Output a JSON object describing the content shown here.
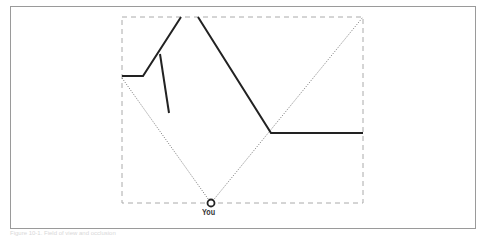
{
  "figure": {
    "type": "field-of-view diagram",
    "viewer_label": "You",
    "caption": "Figure 10-1. Field of view and occlusion",
    "colors": {
      "frame": "#9a9a9a",
      "view_box": "#aaaaaa",
      "walls": "#222222",
      "sight_lines": "#555555"
    },
    "view_box": {
      "x": 122,
      "y": 17,
      "width": 241,
      "height": 186
    },
    "viewer": {
      "x": 211,
      "y": 203
    },
    "walls": [
      {
        "points": "122,76 143,76 181,17"
      },
      {
        "points": "160,54 169,113"
      },
      {
        "points": "198,17 271,133 363,133"
      }
    ],
    "sight_lines": [
      {
        "points": "122,78 211,203"
      },
      {
        "points": "211,203 363,17"
      }
    ]
  }
}
